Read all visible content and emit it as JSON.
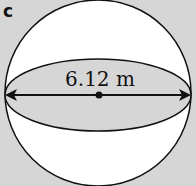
{
  "figure": {
    "label": "c",
    "shape": "sphere",
    "measurement": "6.12 m",
    "measurement_type": "diameter",
    "colors": {
      "background": "#d6d6d6",
      "sphere_fill": "#ffffff",
      "equator_fill": "#d6d6d6",
      "stroke": "#111111"
    }
  }
}
